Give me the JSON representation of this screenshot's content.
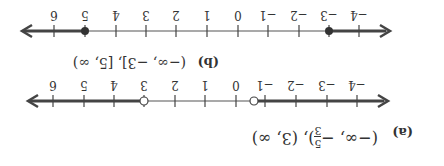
{
  "figure": {
    "orientation": "rotated-180",
    "parts": [
      {
        "id": "a",
        "label": "(a)",
        "interval_parts": [
          "(−∞, −",
          "5",
          "3",
          "), (3, ∞)"
        ],
        "interval_text": "(−∞, −5/3), (3, ∞)",
        "number_line": {
          "ticks": [
            -4,
            -3,
            -2,
            -1,
            0,
            1,
            2,
            3,
            4,
            5,
            6
          ],
          "tick_labels": [
            "−4",
            "−3",
            "−2",
            "−1",
            "0",
            "1",
            "2",
            "3",
            "4",
            "5",
            "6"
          ],
          "open_points": [
            -1.6667,
            3
          ],
          "closed_points": [],
          "shaded": [
            [
              "-inf",
              -1.6667
            ],
            [
              3,
              "inf"
            ]
          ]
        }
      },
      {
        "id": "b",
        "label": "(b)",
        "interval_text": "(−∞, −3], [5, ∞)",
        "number_line": {
          "ticks": [
            -4,
            -3,
            -2,
            -1,
            0,
            1,
            2,
            3,
            4,
            5,
            6
          ],
          "tick_labels": [
            "−4",
            "−3",
            "−2",
            "−1",
            "0",
            "1",
            "2",
            "3",
            "4",
            "5",
            "6"
          ],
          "open_points": [],
          "closed_points": [
            -3,
            5
          ],
          "shaded": [
            [
              "-inf",
              -3
            ],
            [
              5,
              "inf"
            ]
          ]
        }
      }
    ]
  }
}
